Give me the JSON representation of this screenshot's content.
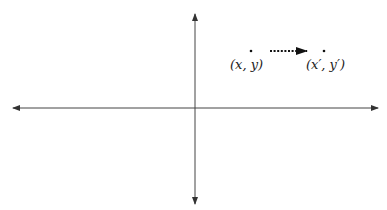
{
  "diagram": {
    "type": "coordinate-plane-translation",
    "axes": {
      "horizontal": {
        "x1": 13,
        "x2": 378,
        "y": 108
      },
      "vertical": {
        "x": 195,
        "y1": 14,
        "y2": 204
      },
      "color": "#333333"
    },
    "points": [
      {
        "id": "original",
        "label": "(x, y)",
        "x": 251,
        "y": 51,
        "label_x": 230,
        "label_y": 69
      },
      {
        "id": "image",
        "label": "(x′, y′)",
        "x": 324,
        "y": 51,
        "label_x": 306,
        "label_y": 69
      }
    ],
    "arrow": {
      "from_x": 270,
      "to_x": 307,
      "y": 51,
      "style": "dotted",
      "color": "#111111"
    }
  }
}
